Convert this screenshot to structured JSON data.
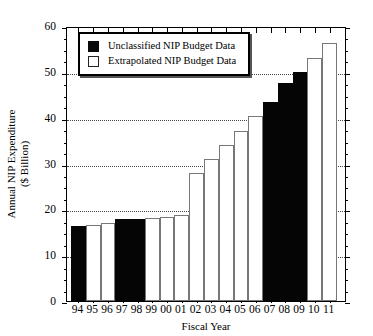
{
  "chart_data": {
    "type": "bar",
    "title": "",
    "xlabel": "Fiscal Year",
    "ylabel": "Annual NIP Expenditure ($ Billion)",
    "ylabel_line1": "Annual NIP Expenditure",
    "ylabel_line2": "($ Billion)",
    "categories": [
      "94",
      "95",
      "96",
      "97",
      "98",
      "99",
      "00",
      "01",
      "02",
      "03",
      "04",
      "05",
      "06",
      "07",
      "08",
      "09",
      "10",
      "11"
    ],
    "values": [
      16.3,
      16.5,
      17.0,
      17.8,
      17.9,
      18.2,
      18.4,
      18.8,
      28.0,
      31.0,
      34.0,
      37.2,
      40.4,
      43.5,
      47.6,
      50.0,
      53.0,
      56.2
    ],
    "bar_types": [
      "unclassified",
      "extrapolated",
      "extrapolated",
      "unclassified",
      "unclassified",
      "extrapolated",
      "extrapolated",
      "extrapolated",
      "extrapolated",
      "extrapolated",
      "extrapolated",
      "extrapolated",
      "extrapolated",
      "unclassified",
      "unclassified",
      "unclassified",
      "extrapolated",
      "extrapolated"
    ],
    "ylim": [
      0,
      60
    ],
    "y_ticks": [
      0,
      10,
      20,
      30,
      40,
      50,
      60
    ],
    "y_minor_step": 2.5,
    "grid": true,
    "grid_axis": "y",
    "legend_position": "upper left",
    "legend": [
      {
        "label": "Unclassified NIP Budget Data",
        "style": "filled",
        "color": "#0a0a0a"
      },
      {
        "label": "Extrapolated NIP Budget Data",
        "style": "open",
        "color": "#ffffff"
      }
    ]
  },
  "colors": {
    "unclassified_fill": "#0a0a0a",
    "extrapolated_fill": "#ffffff",
    "bar_outline": "#777777",
    "axis": "#000000",
    "grid": "#444444",
    "background": "#ffffff"
  }
}
